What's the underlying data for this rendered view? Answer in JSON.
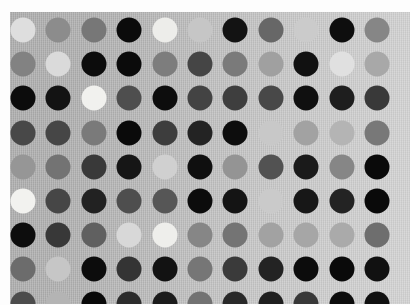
{
  "image": {
    "subject": "polka-dot grayscale fabric swatch",
    "width": 410,
    "height": 305,
    "margin_color": "#fdfdfd",
    "alt_text": "Grayscale polka dot pattern on light gray fabric"
  },
  "fabric": {
    "x": 10,
    "y": 12,
    "width": 400,
    "height": 292,
    "background_left": "#b2b2b2",
    "background_right": "#cacaca",
    "weave_texture": "vertical-rib",
    "label": "fabric-ground"
  },
  "grid": {
    "columns": 11,
    "rows": 9,
    "column_spacing": 35.4,
    "row_spacing": 34.2,
    "first_center_x": 23,
    "first_center_y": 30,
    "dot_diameter": 25,
    "layout": "aligned-square-grid"
  },
  "palette": {
    "black": "#0a0a0a",
    "near_black": "#1a1a1a",
    "charcoal": "#2e2e2e",
    "dark_gray": "#464646",
    "gray": "#5d5d5d",
    "mid_gray": "#7d7d7d",
    "medium_gray": "#8f8f8f",
    "light_gray": "#a6a6a6",
    "pale_gray": "#bdbdbd",
    "off_white": "#d6d6d6",
    "white": "#eeeeee",
    "bright_white": "#f4f4f2"
  },
  "chart_data": {
    "type": "heatmap",
    "xlabel": "",
    "ylabel": "",
    "legend": "none",
    "grid": true,
    "columns": 11,
    "rows": 9,
    "note": "Each cell is one dot; value = dot lightness 0 (black) to 100 (white)",
    "values": [
      [
        88,
        55,
        46,
        4,
        93,
        78,
        8,
        40,
        80,
        6,
        52
      ],
      [
        50,
        86,
        5,
        5,
        48,
        26,
        47,
        62,
        7,
        88,
        66
      ],
      [
        6,
        9,
        95,
        30,
        7,
        26,
        24,
        28,
        8,
        12,
        22
      ],
      [
        28,
        27,
        48,
        4,
        24,
        14,
        5,
        79,
        62,
        70,
        46
      ],
      [
        58,
        44,
        22,
        9,
        82,
        8,
        58,
        32,
        10,
        52,
        4
      ],
      [
        94,
        27,
        13,
        30,
        34,
        5,
        8,
        80,
        9,
        14,
        4
      ],
      [
        6,
        22,
        38,
        84,
        93,
        52,
        44,
        62,
        64,
        66,
        40
      ],
      [
        40,
        78,
        5,
        20,
        7,
        46,
        22,
        14,
        5,
        4,
        7
      ],
      [
        30,
        70,
        4,
        18,
        10,
        44,
        16,
        12,
        22,
        5,
        8
      ]
    ]
  },
  "dots": {
    "row_1": [
      {
        "name": "dot-r1c1",
        "tone": "off-white",
        "color": "#dedede"
      },
      {
        "name": "dot-r1c2",
        "tone": "gray",
        "color": "#8c8c8c"
      },
      {
        "name": "dot-r1c3",
        "tone": "gray",
        "color": "#777777"
      },
      {
        "name": "dot-r1c4",
        "tone": "black",
        "color": "#0b0b0b"
      },
      {
        "name": "dot-r1c5",
        "tone": "bright-white",
        "color": "#ededea"
      },
      {
        "name": "dot-r1c6",
        "tone": "pale-gray",
        "color": "#c6c6c6"
      },
      {
        "name": "dot-r1c7",
        "tone": "near-black",
        "color": "#131313"
      },
      {
        "name": "dot-r1c8",
        "tone": "dark-gray",
        "color": "#676767"
      },
      {
        "name": "dot-r1c9",
        "tone": "pale-gray",
        "color": "#cbcbcb"
      },
      {
        "name": "dot-r1c10",
        "tone": "black",
        "color": "#0e0e0e"
      },
      {
        "name": "dot-r1c11",
        "tone": "gray",
        "color": "#868686"
      }
    ],
    "row_2": [
      {
        "name": "dot-r2c1",
        "tone": "medium-gray",
        "color": "#828282"
      },
      {
        "name": "dot-r2c2",
        "tone": "off-white",
        "color": "#dadada"
      },
      {
        "name": "dot-r2c3",
        "tone": "black",
        "color": "#0c0c0c"
      },
      {
        "name": "dot-r2c4",
        "tone": "black",
        "color": "#0b0b0b"
      },
      {
        "name": "dot-r2c5",
        "tone": "gray",
        "color": "#7d7d7d"
      },
      {
        "name": "dot-r2c6",
        "tone": "charcoal",
        "color": "#454545"
      },
      {
        "name": "dot-r2c7",
        "tone": "gray",
        "color": "#7a7a7a"
      },
      {
        "name": "dot-r2c8",
        "tone": "light-gray",
        "color": "#a0a0a0"
      },
      {
        "name": "dot-r2c9",
        "tone": "black",
        "color": "#111111"
      },
      {
        "name": "dot-r2c10",
        "tone": "off-white",
        "color": "#e0e0e0"
      },
      {
        "name": "dot-r2c11",
        "tone": "light-gray",
        "color": "#a8a8a8"
      }
    ],
    "row_3": [
      {
        "name": "dot-r3c1",
        "tone": "black",
        "color": "#0c0c0c"
      },
      {
        "name": "dot-r3c2",
        "tone": "black",
        "color": "#131313"
      },
      {
        "name": "dot-r3c3",
        "tone": "bright-white",
        "color": "#f1f1ee"
      },
      {
        "name": "dot-r3c4",
        "tone": "dark-gray",
        "color": "#4e4e4e"
      },
      {
        "name": "dot-r3c5",
        "tone": "black",
        "color": "#0d0d0d"
      },
      {
        "name": "dot-r3c6",
        "tone": "charcoal",
        "color": "#434343"
      },
      {
        "name": "dot-r3c7",
        "tone": "charcoal",
        "color": "#3e3e3e"
      },
      {
        "name": "dot-r3c8",
        "tone": "charcoal",
        "color": "#484848"
      },
      {
        "name": "dot-r3c9",
        "tone": "black",
        "color": "#101010"
      },
      {
        "name": "dot-r3c10",
        "tone": "near-black",
        "color": "#1e1e1e"
      },
      {
        "name": "dot-r3c11",
        "tone": "charcoal",
        "color": "#393939"
      }
    ],
    "row_4": [
      {
        "name": "dot-r4c1",
        "tone": "charcoal",
        "color": "#484848"
      },
      {
        "name": "dot-r4c2",
        "tone": "charcoal",
        "color": "#464646"
      },
      {
        "name": "dot-r4c3",
        "tone": "dark-gray",
        "color": "#7a7a7a"
      },
      {
        "name": "dot-r4c4",
        "tone": "black",
        "color": "#0a0a0a"
      },
      {
        "name": "dot-r4c5",
        "tone": "charcoal",
        "color": "#3d3d3d"
      },
      {
        "name": "dot-r4c6",
        "tone": "near-black",
        "color": "#232323"
      },
      {
        "name": "dot-r4c7",
        "tone": "black",
        "color": "#0d0d0d"
      },
      {
        "name": "dot-r4c8",
        "tone": "pale-gray",
        "color": "#c8c8c8"
      },
      {
        "name": "dot-r4c9",
        "tone": "light-gray",
        "color": "#a2a2a2"
      },
      {
        "name": "dot-r4c10",
        "tone": "light-gray",
        "color": "#b4b4b4"
      },
      {
        "name": "dot-r4c11",
        "tone": "medium-gray",
        "color": "#787878"
      }
    ],
    "row_5": [
      {
        "name": "dot-r5c1",
        "tone": "medium-gray",
        "color": "#969696"
      },
      {
        "name": "dot-r5c2",
        "tone": "gray",
        "color": "#737373"
      },
      {
        "name": "dot-r5c3",
        "tone": "charcoal",
        "color": "#393939"
      },
      {
        "name": "dot-r5c4",
        "tone": "near-black",
        "color": "#161616"
      },
      {
        "name": "dot-r5c5",
        "tone": "pale-gray",
        "color": "#d0d0d0"
      },
      {
        "name": "dot-r5c6",
        "tone": "black",
        "color": "#0f0f0f"
      },
      {
        "name": "dot-r5c7",
        "tone": "medium-gray",
        "color": "#949494"
      },
      {
        "name": "dot-r5c8",
        "tone": "dark-gray",
        "color": "#525252"
      },
      {
        "name": "dot-r5c9",
        "tone": "near-black",
        "color": "#1a1a1a"
      },
      {
        "name": "dot-r5c10",
        "tone": "gray",
        "color": "#868686"
      },
      {
        "name": "dot-r5c11",
        "tone": "black",
        "color": "#0a0a0a"
      }
    ],
    "row_6": [
      {
        "name": "dot-r6c1",
        "tone": "bright-white",
        "color": "#f2f2ef"
      },
      {
        "name": "dot-r6c2",
        "tone": "charcoal",
        "color": "#464646"
      },
      {
        "name": "dot-r6c3",
        "tone": "near-black",
        "color": "#222222"
      },
      {
        "name": "dot-r6c4",
        "tone": "dark-gray",
        "color": "#4e4e4e"
      },
      {
        "name": "dot-r6c5",
        "tone": "dark-gray",
        "color": "#565656"
      },
      {
        "name": "dot-r6c6",
        "tone": "black",
        "color": "#0c0c0c"
      },
      {
        "name": "dot-r6c7",
        "tone": "near-black",
        "color": "#141414"
      },
      {
        "name": "dot-r6c8",
        "tone": "pale-gray",
        "color": "#cacaca"
      },
      {
        "name": "dot-r6c9",
        "tone": "near-black",
        "color": "#171717"
      },
      {
        "name": "dot-r6c10",
        "tone": "near-black",
        "color": "#232323"
      },
      {
        "name": "dot-r6c11",
        "tone": "black",
        "color": "#0a0a0a"
      }
    ],
    "row_7": [
      {
        "name": "dot-r7c1",
        "tone": "black",
        "color": "#0d0d0d"
      },
      {
        "name": "dot-r7c2",
        "tone": "charcoal",
        "color": "#383838"
      },
      {
        "name": "dot-r7c3",
        "tone": "dark-gray",
        "color": "#606060"
      },
      {
        "name": "dot-r7c4",
        "tone": "off-white",
        "color": "#d8d8d8"
      },
      {
        "name": "dot-r7c5",
        "tone": "bright-white",
        "color": "#eeeeeb"
      },
      {
        "name": "dot-r7c6",
        "tone": "medium-gray",
        "color": "#868686"
      },
      {
        "name": "dot-r7c7",
        "tone": "gray",
        "color": "#747474"
      },
      {
        "name": "dot-r7c8",
        "tone": "light-gray",
        "color": "#a2a2a2"
      },
      {
        "name": "dot-r7c9",
        "tone": "light-gray",
        "color": "#a6a6a6"
      },
      {
        "name": "dot-r7c10",
        "tone": "light-gray",
        "color": "#aaaaaa"
      },
      {
        "name": "dot-r7c11",
        "tone": "medium-gray",
        "color": "#6e6e6e"
      }
    ],
    "row_8": [
      {
        "name": "dot-r8c1",
        "tone": "medium-gray",
        "color": "#6c6c6c"
      },
      {
        "name": "dot-r8c2",
        "tone": "light-gray",
        "color": "#c6c6c6"
      },
      {
        "name": "dot-r8c3",
        "tone": "black",
        "color": "#0c0c0c"
      },
      {
        "name": "dot-r8c4",
        "tone": "charcoal",
        "color": "#343434"
      },
      {
        "name": "dot-r8c5",
        "tone": "near-black",
        "color": "#121212"
      },
      {
        "name": "dot-r8c6",
        "tone": "dark-gray",
        "color": "#767676"
      },
      {
        "name": "dot-r8c7",
        "tone": "charcoal",
        "color": "#3a3a3a"
      },
      {
        "name": "dot-r8c8",
        "tone": "near-black",
        "color": "#232323"
      },
      {
        "name": "dot-r8c9",
        "tone": "black",
        "color": "#0c0c0c"
      },
      {
        "name": "dot-r8c10",
        "tone": "black",
        "color": "#0a0a0a"
      },
      {
        "name": "dot-r8c11",
        "tone": "black",
        "color": "#111111"
      }
    ],
    "row_9": [
      {
        "name": "dot-r9c1",
        "tone": "charcoal",
        "color": "#4c4c4c"
      },
      {
        "name": "dot-r9c2",
        "tone": "light-gray",
        "color": "#b4b4b4"
      },
      {
        "name": "dot-r9c3",
        "tone": "black",
        "color": "#090909"
      },
      {
        "name": "dot-r9c4",
        "tone": "near-black",
        "color": "#2c2c2c"
      },
      {
        "name": "dot-r9c5",
        "tone": "near-black",
        "color": "#1b1b1b"
      },
      {
        "name": "dot-r9c6",
        "tone": "dark-gray",
        "color": "#727272"
      },
      {
        "name": "dot-r9c7",
        "tone": "near-black",
        "color": "#292929"
      },
      {
        "name": "dot-r9c8",
        "tone": "near-black",
        "color": "#1f1f1f"
      },
      {
        "name": "dot-r9c9",
        "tone": "charcoal",
        "color": "#383838"
      },
      {
        "name": "dot-r9c10",
        "tone": "black",
        "color": "#0c0c0c"
      },
      {
        "name": "dot-r9c11",
        "tone": "black",
        "color": "#101010"
      }
    ]
  }
}
